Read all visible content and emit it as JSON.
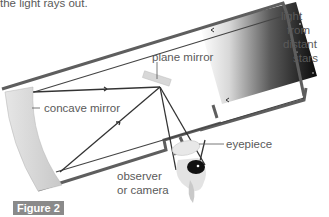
{
  "caption_top": "the light rays out.",
  "labels": {
    "light_source": [
      "light",
      "from",
      "distant",
      "stars"
    ],
    "plane_mirror": "plane mirror",
    "concave_mirror": "concave mirror",
    "eyepiece": "eyepiece",
    "observer": [
      "observer",
      "or camera"
    ]
  },
  "figure_label": "Figure 2",
  "colors": {
    "tube_outline": "#5e5e5e",
    "ray": "#3a3a3a",
    "mirror_fill": "#d9d9d9",
    "sky_dark": "#111111",
    "figure_badge": "#8a8a8a"
  }
}
